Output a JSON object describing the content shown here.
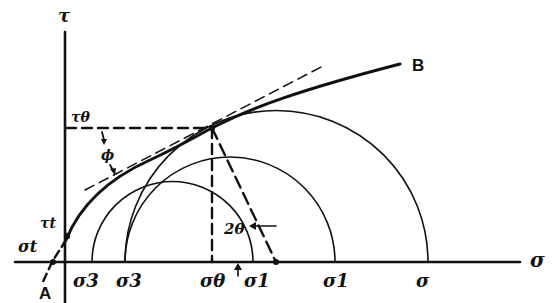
{
  "diagram": {
    "type": "mohr_circle_failure_envelope",
    "axes": {
      "x_label": "σ",
      "y_label": "τ"
    },
    "curve_labels": {
      "start": "A",
      "end": "B"
    },
    "point_labels": {
      "tau_theta": "τθ",
      "tau_t": "τt",
      "sigma_t": "σt",
      "phi": "ϕ",
      "two_theta": "2θ"
    },
    "x_tick_labels": [
      {
        "id": "sigma3_a",
        "text": "σ3"
      },
      {
        "id": "sigma3_b",
        "text": "σ3"
      },
      {
        "id": "sigma_theta",
        "text": "σθ"
      },
      {
        "id": "sigma1_a",
        "text": "σ1"
      },
      {
        "id": "sigma1_b",
        "text": "σ1"
      },
      {
        "id": "sigma",
        "text": "σ"
      }
    ],
    "circles": [
      {
        "name": "circle-1",
        "left": "σ3",
        "right": "σ1"
      },
      {
        "name": "circle-2",
        "left": "σ3",
        "right": "σ1"
      },
      {
        "name": "circle-3",
        "left": "σ3",
        "right": "σ"
      }
    ],
    "colors": {
      "ink": "#111111",
      "background": "#ffffff"
    }
  }
}
